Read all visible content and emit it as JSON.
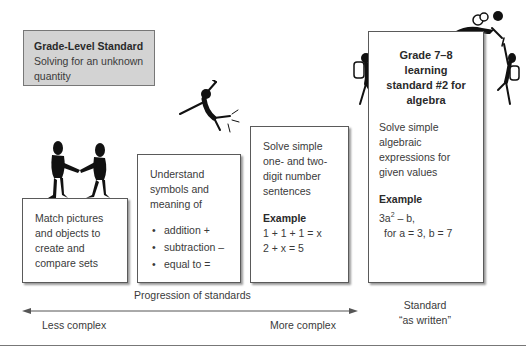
{
  "grade_level_box": {
    "title": "Grade-Level Standard",
    "text": "Solving for an unknown quantity"
  },
  "boxes": [
    {
      "text": "Match pictures and objects to create and compare sets"
    },
    {
      "text": "Understand symbols and meaning of",
      "bullets": [
        "addition +",
        "subtraction –",
        "equal to ="
      ]
    },
    {
      "text": "Solve simple one- and two-digit number sentences",
      "example_label": "Example",
      "examples": [
        "1 + 1 + 1 = x",
        "2 + x  = 5"
      ]
    },
    {
      "title": "Grade 7–8 learning standard #2 for algebra",
      "text": "Solve simple algebraic expressions for given values",
      "example_label": "Example",
      "expression_base": "3a",
      "expression_exp": "2",
      "expression_rest": " – b,",
      "expression_values": "for a = 3, b = 7"
    }
  ],
  "progression": {
    "label": "Progression of standards",
    "left": "Less complex",
    "right": "More complex"
  },
  "standard_label": {
    "line1": "Standard",
    "line2": "“as written”"
  },
  "figures": [
    "handshake-figures-icon",
    "jumping-figure-icon",
    "climbing-figure-icon",
    "summit-climbers-icon"
  ],
  "colors": {
    "grade_box_bg": "#d3d3d3",
    "box_border": "#5a5a5a",
    "text": "#3a3a3a",
    "figure": "#111111"
  }
}
